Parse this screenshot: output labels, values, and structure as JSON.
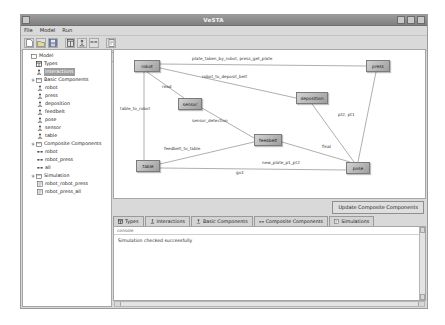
{
  "window": {
    "title": "VeSTA",
    "controls": {
      "minimize": "_",
      "maximize": "□",
      "close": "×"
    }
  },
  "menu": {
    "items": [
      "File",
      "Model",
      "Run"
    ]
  },
  "toolbar": {
    "buttons": [
      {
        "name": "new-file-icon",
        "label": "New"
      },
      {
        "name": "open-folder-icon",
        "label": "Open"
      },
      {
        "name": "save-disk-icon",
        "label": "Save"
      },
      {
        "name": "types-icon",
        "label": "Types"
      },
      {
        "name": "interactions-icon",
        "label": "Interactions"
      },
      {
        "name": "components-icon",
        "label": "Components"
      },
      {
        "name": "simulations-icon",
        "label": "Simulations"
      }
    ]
  },
  "tree": {
    "root": "Model",
    "nodes": [
      {
        "label": "Types",
        "icon": "types-icon",
        "indent": 1,
        "selected": false,
        "twisty": ""
      },
      {
        "label": "Interactions",
        "icon": "interactions-icon",
        "indent": 1,
        "selected": true,
        "twisty": ""
      },
      {
        "label": "Basic Components",
        "icon": "folder-icon",
        "indent": 1,
        "selected": false,
        "twisty": "♀"
      },
      {
        "label": "robot",
        "icon": "component-icon",
        "indent": 2,
        "selected": false,
        "twisty": ""
      },
      {
        "label": "press",
        "icon": "component-icon",
        "indent": 2,
        "selected": false,
        "twisty": ""
      },
      {
        "label": "deposition",
        "icon": "component-icon",
        "indent": 2,
        "selected": false,
        "twisty": ""
      },
      {
        "label": "feedbelt",
        "icon": "component-icon",
        "indent": 2,
        "selected": false,
        "twisty": ""
      },
      {
        "label": "pose",
        "icon": "component-icon",
        "indent": 2,
        "selected": false,
        "twisty": ""
      },
      {
        "label": "sensor",
        "icon": "component-icon",
        "indent": 2,
        "selected": false,
        "twisty": ""
      },
      {
        "label": "table",
        "icon": "component-icon",
        "indent": 2,
        "selected": false,
        "twisty": ""
      },
      {
        "label": "Composite Components",
        "icon": "folder-icon",
        "indent": 1,
        "selected": false,
        "twisty": "♀"
      },
      {
        "label": "robot",
        "icon": "composite-icon",
        "indent": 2,
        "selected": false,
        "twisty": ""
      },
      {
        "label": "robot_press",
        "icon": "composite-icon",
        "indent": 2,
        "selected": false,
        "twisty": ""
      },
      {
        "label": "all",
        "icon": "composite-icon",
        "indent": 2,
        "selected": false,
        "twisty": ""
      },
      {
        "label": "Simulation",
        "icon": "folder-icon",
        "indent": 1,
        "selected": false,
        "twisty": "♀"
      },
      {
        "label": "robot_robot_press",
        "icon": "simulation-icon",
        "indent": 2,
        "selected": false,
        "twisty": ""
      },
      {
        "label": "robot_press_all",
        "icon": "simulation-icon",
        "indent": 2,
        "selected": false,
        "twisty": ""
      }
    ]
  },
  "graph": {
    "nodes": [
      {
        "id": "robot",
        "label": "robot",
        "x": 20,
        "y": 10,
        "w": 26,
        "h": 12
      },
      {
        "id": "press",
        "label": "press",
        "x": 252,
        "y": 10,
        "w": 24,
        "h": 12
      },
      {
        "id": "deposition",
        "label": "deposition",
        "x": 182,
        "y": 42,
        "w": 32,
        "h": 12
      },
      {
        "id": "sensor",
        "label": "sensor",
        "x": 64,
        "y": 48,
        "w": 24,
        "h": 12
      },
      {
        "id": "feedbelt",
        "label": "feedbelt",
        "x": 140,
        "y": 84,
        "w": 28,
        "h": 12
      },
      {
        "id": "table",
        "label": "table",
        "x": 22,
        "y": 110,
        "w": 24,
        "h": 12
      },
      {
        "id": "pose",
        "label": "pose",
        "x": 232,
        "y": 112,
        "w": 24,
        "h": 12
      }
    ],
    "edge_labels": [
      {
        "text": "plate_taken_by_robot, press_get_plate",
        "x": 78,
        "y": 6
      },
      {
        "text": "robot_to_deposit_belt",
        "x": 88,
        "y": 24
      },
      {
        "text": "read",
        "x": 48,
        "y": 34
      },
      {
        "text": "table_to_robot",
        "x": 8,
        "y": 56
      },
      {
        "text": "sensor_detection",
        "x": 78,
        "y": 68
      },
      {
        "text": "pt2, pt1",
        "x": 222,
        "y": 62
      },
      {
        "text": "feedbelt_to_table",
        "x": 50,
        "y": 96
      },
      {
        "text": "final",
        "x": 206,
        "y": 96
      },
      {
        "text": "new_plate_p1_pt2",
        "x": 148,
        "y": 110
      },
      {
        "text": "go1",
        "x": 122,
        "y": 120
      }
    ]
  },
  "actions": {
    "update_composite": "Update Composite Components"
  },
  "tabs": [
    {
      "label": "Types",
      "icon": "types-icon",
      "active": false
    },
    {
      "label": "Interactions",
      "icon": "interactions-icon",
      "active": false
    },
    {
      "label": "Basic Components",
      "icon": "basic-components-icon",
      "active": false
    },
    {
      "label": "Composite Components",
      "icon": "composite-components-icon",
      "active": false
    },
    {
      "label": "Simulations",
      "icon": "simulations-icon",
      "active": false
    }
  ],
  "console": {
    "header": "console",
    "message": "Simulation checked successfully"
  },
  "status": {
    "text": "Current project : karos    bee : -"
  }
}
